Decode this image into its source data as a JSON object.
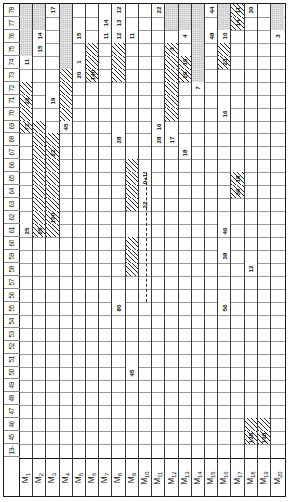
{
  "chart_data": {
    "type": "table",
    "xlabel": "Machines",
    "ylabel": "Time periods",
    "orientation": "rotated-90",
    "machines": [
      "M1",
      "M2",
      "M3",
      "M4",
      "M5",
      "M6",
      "M7",
      "M8",
      "M9",
      "M10",
      "M11",
      "M12",
      "M13",
      "M14",
      "M15",
      "M16",
      "M17",
      "M18",
      "M19",
      "M20"
    ],
    "machine_labels": [
      "M₁",
      "M₂",
      "M₃",
      "M₄",
      "M₅",
      "M₆",
      "M₇",
      "M₈",
      "M₉",
      "M₁₀",
      "M₁₁",
      "M₁₂",
      "M₁₃",
      "M₁₄",
      "M₁₅",
      "M₁₆",
      "M₁₇",
      "M₁₈",
      "M₁₉",
      "M₂₀"
    ],
    "time_axis_first_label": "19-",
    "time_ticks": [
      78,
      77,
      76,
      75,
      74,
      73,
      72,
      71,
      70,
      69,
      68,
      67,
      66,
      65,
      64,
      63,
      62,
      61,
      60,
      59,
      58,
      57,
      56,
      55,
      54,
      53,
      52,
      51,
      50,
      49,
      48,
      47,
      46,
      45,
      "19-"
    ],
    "ylim": [
      19,
      78
    ],
    "grid": true,
    "legend_position": "none",
    "fills": {
      "gray": "#c9c9c9",
      "hatch": "#2b2b2b",
      "blank": "#ffffff"
    },
    "annotations": [
      {
        "text": "10+15",
        "machine": "M11",
        "note": "dashed-connector-top"
      },
      {
        "text": "22",
        "machine": "M11",
        "note": "dashed-connector-lower"
      }
    ],
    "cells": [
      {
        "m": 1,
        "t": 78,
        "fill": "gray",
        "v": ""
      },
      {
        "m": 1,
        "t": 77,
        "fill": "gray",
        "v": ""
      },
      {
        "m": 1,
        "t": 76,
        "fill": "gray",
        "v": ""
      },
      {
        "m": 1,
        "t": 75,
        "fill": "gray",
        "v": ""
      },
      {
        "m": 1,
        "t": 74,
        "fill": "blank",
        "v": "11"
      },
      {
        "m": 1,
        "t": 72,
        "fill": "hatch",
        "v": ""
      },
      {
        "m": 1,
        "t": 71,
        "fill": "hatch",
        "v": "22"
      },
      {
        "m": 1,
        "t": 70,
        "fill": "hatch",
        "v": ""
      },
      {
        "m": 1,
        "t": 69,
        "fill": "hatch",
        "v": "72"
      },
      {
        "m": 1,
        "t": 61,
        "fill": "blank",
        "v": "25"
      },
      {
        "m": 2,
        "t": 78,
        "fill": "gray",
        "v": ""
      },
      {
        "m": 2,
        "t": 77,
        "fill": "gray",
        "v": ""
      },
      {
        "m": 2,
        "t": 76,
        "fill": "blank",
        "v": "14"
      },
      {
        "m": 2,
        "t": 75,
        "fill": "blank",
        "v": "15"
      },
      {
        "m": 2,
        "t": 69,
        "fill": "hatch",
        "v": ""
      },
      {
        "m": 2,
        "t": 68,
        "fill": "hatch",
        "v": ""
      },
      {
        "m": 2,
        "t": 67,
        "fill": "hatch",
        "v": ""
      },
      {
        "m": 2,
        "t": 66,
        "fill": "hatch",
        "v": ""
      },
      {
        "m": 2,
        "t": 65,
        "fill": "hatch",
        "v": ""
      },
      {
        "m": 2,
        "t": 64,
        "fill": "hatch",
        "v": ""
      },
      {
        "m": 2,
        "t": 63,
        "fill": "hatch",
        "v": ""
      },
      {
        "m": 2,
        "t": 62,
        "fill": "hatch",
        "v": ""
      },
      {
        "m": 2,
        "t": 61,
        "fill": "hatch",
        "v": "25"
      },
      {
        "m": 3,
        "t": 78,
        "fill": "blank",
        "v": "17"
      },
      {
        "m": 3,
        "t": 71,
        "fill": "blank",
        "v": "19"
      },
      {
        "m": 3,
        "t": 68,
        "fill": "hatch",
        "v": ""
      },
      {
        "m": 3,
        "t": 67,
        "fill": "hatch",
        "v": "22"
      },
      {
        "m": 3,
        "t": 66,
        "fill": "hatch",
        "v": ""
      },
      {
        "m": 3,
        "t": 65,
        "fill": "hatch",
        "v": ""
      },
      {
        "m": 3,
        "t": 64,
        "fill": "hatch",
        "v": ""
      },
      {
        "m": 3,
        "t": 63,
        "fill": "hatch",
        "v": ""
      },
      {
        "m": 3,
        "t": 62,
        "fill": "hatch",
        "v": "100"
      },
      {
        "m": 3,
        "t": 61,
        "fill": "hatch",
        "v": ""
      },
      {
        "m": 4,
        "t": 78,
        "fill": "gray",
        "v": ""
      },
      {
        "m": 4,
        "t": 77,
        "fill": "gray",
        "v": ""
      },
      {
        "m": 4,
        "t": 76,
        "fill": "gray",
        "v": ""
      },
      {
        "m": 4,
        "t": 75,
        "fill": "gray",
        "v": ""
      },
      {
        "m": 4,
        "t": 74,
        "fill": "gray",
        "v": ""
      },
      {
        "m": 4,
        "t": 73,
        "fill": "gray",
        "v": ""
      },
      {
        "m": 4,
        "t": 72,
        "fill": "gray",
        "v": ""
      },
      {
        "m": 4,
        "t": 73,
        "fill": "hatch",
        "v": ""
      },
      {
        "m": 4,
        "t": 72,
        "fill": "hatch",
        "v": ""
      },
      {
        "m": 4,
        "t": 71,
        "fill": "hatch",
        "v": ""
      },
      {
        "m": 4,
        "t": 70,
        "fill": "hatch",
        "v": ""
      },
      {
        "m": 4,
        "t": 69,
        "fill": "blank",
        "v": "45"
      },
      {
        "m": 5,
        "t": 76,
        "fill": "blank",
        "v": "15"
      },
      {
        "m": 5,
        "t": 74,
        "fill": "blank",
        "v": "1"
      },
      {
        "m": 5,
        "t": 73,
        "fill": "blank",
        "v": "20"
      },
      {
        "m": 6,
        "t": 75,
        "fill": "hatch",
        "v": ""
      },
      {
        "m": 6,
        "t": 74,
        "fill": "hatch",
        "v": ""
      },
      {
        "m": 6,
        "t": 73,
        "fill": "hatch",
        "v": "140"
      },
      {
        "m": 7,
        "t": 77,
        "fill": "blank",
        "v": "14"
      },
      {
        "m": 7,
        "t": 76,
        "fill": "blank",
        "v": "11"
      },
      {
        "m": 8,
        "t": 78,
        "fill": "blank",
        "v": "12"
      },
      {
        "m": 8,
        "t": 77,
        "fill": "blank",
        "v": "13"
      },
      {
        "m": 8,
        "t": 76,
        "fill": "blank",
        "v": "12"
      },
      {
        "m": 8,
        "t": 75,
        "fill": "hatch",
        "v": ""
      },
      {
        "m": 8,
        "t": 74,
        "fill": "hatch",
        "v": ""
      },
      {
        "m": 8,
        "t": 73,
        "fill": "hatch",
        "v": ""
      },
      {
        "m": 8,
        "t": 68,
        "fill": "blank",
        "v": "28"
      },
      {
        "m": 8,
        "t": 55,
        "fill": "blank",
        "v": "80"
      },
      {
        "m": 9,
        "t": 76,
        "fill": "blank",
        "v": "11"
      },
      {
        "m": 9,
        "t": 66,
        "fill": "hatch",
        "v": ""
      },
      {
        "m": 9,
        "t": 65,
        "fill": "hatch",
        "v": ""
      },
      {
        "m": 9,
        "t": 64,
        "fill": "hatch",
        "v": ""
      },
      {
        "m": 9,
        "t": 63,
        "fill": "hatch",
        "v": ""
      },
      {
        "m": 9,
        "t": 60,
        "fill": "hatch",
        "v": ""
      },
      {
        "m": 9,
        "t": 59,
        "fill": "hatch",
        "v": ""
      },
      {
        "m": 9,
        "t": 58,
        "fill": "hatch",
        "v": ""
      },
      {
        "m": 9,
        "t": 50,
        "fill": "blank",
        "v": "45"
      },
      {
        "m": 10,
        "t": 65,
        "fill": "blank",
        "v": "10+15"
      },
      {
        "m": 10,
        "t": 63,
        "fill": "blank",
        "v": "22"
      },
      {
        "m": 11,
        "t": 78,
        "fill": "blank",
        "v": "22"
      },
      {
        "m": 11,
        "t": 69,
        "fill": "blank",
        "v": "16"
      },
      {
        "m": 11,
        "t": 68,
        "fill": "blank",
        "v": "28"
      },
      {
        "m": 12,
        "t": 78,
        "fill": "gray",
        "v": ""
      },
      {
        "m": 12,
        "t": 77,
        "fill": "gray",
        "v": ""
      },
      {
        "m": 12,
        "t": 75,
        "fill": "hatch",
        "v": "3"
      },
      {
        "m": 12,
        "t": 74,
        "fill": "hatch",
        "v": ""
      },
      {
        "m": 12,
        "t": 73,
        "fill": "hatch",
        "v": ""
      },
      {
        "m": 12,
        "t": 72,
        "fill": "hatch",
        "v": ""
      },
      {
        "m": 12,
        "t": 71,
        "fill": "hatch",
        "v": ""
      },
      {
        "m": 12,
        "t": 70,
        "fill": "hatch",
        "v": ""
      },
      {
        "m": 12,
        "t": 68,
        "fill": "blank",
        "v": "17"
      },
      {
        "m": 13,
        "t": 78,
        "fill": "gray",
        "v": ""
      },
      {
        "m": 13,
        "t": 77,
        "fill": "gray",
        "v": ""
      },
      {
        "m": 13,
        "t": 76,
        "fill": "blank",
        "v": "4"
      },
      {
        "m": 13,
        "t": 74,
        "fill": "hatch",
        "v": "19"
      },
      {
        "m": 13,
        "t": 73,
        "fill": "hatch",
        "v": "29"
      },
      {
        "m": 13,
        "t": 67,
        "fill": "blank",
        "v": "18"
      },
      {
        "m": 14,
        "t": 78,
        "fill": "gray",
        "v": ""
      },
      {
        "m": 14,
        "t": 77,
        "fill": "gray",
        "v": ""
      },
      {
        "m": 14,
        "t": 76,
        "fill": "gray",
        "v": ""
      },
      {
        "m": 14,
        "t": 75,
        "fill": "gray",
        "v": ""
      },
      {
        "m": 14,
        "t": 74,
        "fill": "gray",
        "v": ""
      },
      {
        "m": 14,
        "t": 73,
        "fill": "gray",
        "v": ""
      },
      {
        "m": 14,
        "t": 72,
        "fill": "blank",
        "v": "7"
      },
      {
        "m": 15,
        "t": 78,
        "fill": "blank",
        "v": "44"
      },
      {
        "m": 15,
        "t": 76,
        "fill": "blank",
        "v": "48"
      },
      {
        "m": 16,
        "t": 78,
        "fill": "gray",
        "v": ""
      },
      {
        "m": 16,
        "t": 77,
        "fill": "gray",
        "v": ""
      },
      {
        "m": 16,
        "t": 76,
        "fill": "blank",
        "v": "10"
      },
      {
        "m": 16,
        "t": 75,
        "fill": "hatch",
        "v": ""
      },
      {
        "m": 16,
        "t": 74,
        "fill": "hatch",
        "v": "23"
      },
      {
        "m": 16,
        "t": 70,
        "fill": "blank",
        "v": "16"
      },
      {
        "m": 16,
        "t": 61,
        "fill": "blank",
        "v": "46"
      },
      {
        "m": 16,
        "t": 59,
        "fill": "blank",
        "v": "38"
      },
      {
        "m": 16,
        "t": 55,
        "fill": "blank",
        "v": "56"
      },
      {
        "m": 17,
        "t": 78,
        "fill": "hatch",
        "v": "11"
      },
      {
        "m": 17,
        "t": 77,
        "fill": "hatch",
        "v": "14"
      },
      {
        "m": 17,
        "t": 65,
        "fill": "hatch",
        "v": "18"
      },
      {
        "m": 17,
        "t": 64,
        "fill": "hatch",
        "v": "36"
      },
      {
        "m": 18,
        "t": 78,
        "fill": "blank",
        "v": "30"
      },
      {
        "m": 18,
        "t": 58,
        "fill": "blank",
        "v": "12"
      },
      {
        "m": 18,
        "t": 46,
        "fill": "hatch",
        "v": ""
      },
      {
        "m": 18,
        "t": 45,
        "fill": "hatch",
        "v": "138"
      },
      {
        "m": 19,
        "t": 46,
        "fill": "hatch",
        "v": ""
      },
      {
        "m": 19,
        "t": 45,
        "fill": "hatch",
        "v": "108"
      },
      {
        "m": 20,
        "t": 78,
        "fill": "gray",
        "v": ""
      },
      {
        "m": 20,
        "t": 77,
        "fill": "gray",
        "v": ""
      },
      {
        "m": 20,
        "t": 76,
        "fill": "blank",
        "v": "3"
      }
    ]
  }
}
